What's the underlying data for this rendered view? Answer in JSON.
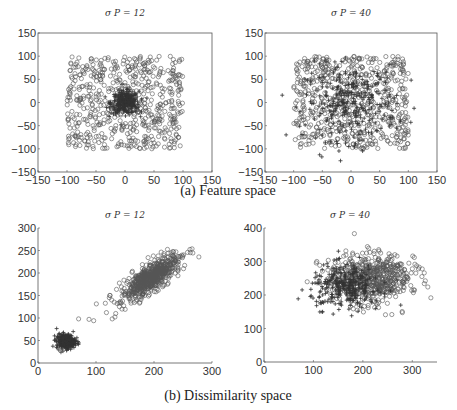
{
  "figure": {
    "caption_a": "(a) Feature space",
    "caption_b": "(b) Dissimilarity space"
  },
  "colors": {
    "axis": "#555555",
    "circle": "#555555",
    "plus": "#333333",
    "background": "#ffffff"
  },
  "chart_data": [
    {
      "id": "feature-sigma12",
      "type": "scatter",
      "title": "σ P = 12",
      "xlabel": "",
      "ylabel": "",
      "xlim": [
        -150,
        150
      ],
      "ylim": [
        -150,
        150
      ],
      "xticks": [
        -150,
        -100,
        -50,
        0,
        50,
        100,
        150
      ],
      "yticks": [
        -150,
        -100,
        -50,
        0,
        50,
        100,
        150
      ],
      "box": true,
      "grid": false,
      "pixel_box": {
        "x0": 38,
        "x1": 212,
        "y0": 172,
        "y1": 33
      },
      "series": [
        {
          "name": "class o",
          "marker": "circle",
          "distribution": "uniform",
          "x_range": [
            -100,
            100
          ],
          "y_range": [
            -100,
            100
          ],
          "count": 600
        },
        {
          "name": "class +",
          "marker": "plus",
          "distribution": "gaussian",
          "center": [
            0,
            0
          ],
          "sigma": 12,
          "count": 300
        }
      ]
    },
    {
      "id": "feature-sigma40",
      "type": "scatter",
      "title": "σ P = 40",
      "xlabel": "",
      "ylabel": "",
      "xlim": [
        -150,
        150
      ],
      "ylim": [
        -150,
        150
      ],
      "xticks": [
        -150,
        -100,
        -50,
        0,
        50,
        100,
        150
      ],
      "yticks": [
        -150,
        -100,
        -50,
        0,
        50,
        100,
        150
      ],
      "box": true,
      "grid": false,
      "pixel_box": {
        "x0": 265,
        "x1": 437,
        "y0": 172,
        "y1": 33
      },
      "series": [
        {
          "name": "class o",
          "marker": "circle",
          "distribution": "uniform",
          "x_range": [
            -100,
            100
          ],
          "y_range": [
            -100,
            100
          ],
          "count": 600
        },
        {
          "name": "class +",
          "marker": "plus",
          "distribution": "gaussian",
          "center": [
            0,
            0
          ],
          "sigma": 40,
          "count": 300
        }
      ]
    },
    {
      "id": "dissimilarity-sigma12",
      "type": "scatter",
      "title": "σ P = 12",
      "xlabel": "",
      "ylabel": "",
      "xlim": [
        0,
        300
      ],
      "ylim": [
        0,
        300
      ],
      "xticks": [
        0,
        100,
        200,
        300
      ],
      "yticks": [
        0,
        50,
        100,
        150,
        200,
        250,
        300
      ],
      "box": false,
      "grid": false,
      "pixel_box": {
        "x0": 38,
        "x1": 212,
        "y0": 363,
        "y1": 228
      },
      "series": [
        {
          "name": "class o",
          "marker": "circle",
          "distribution": "correlated",
          "center": [
            195,
            190
          ],
          "sigma_major": 32,
          "sigma_minor": 12,
          "angle_deg": 45,
          "count": 650
        },
        {
          "name": "class +",
          "marker": "plus",
          "distribution": "gaussian",
          "center": [
            48,
            48
          ],
          "sigma": 8,
          "count": 300
        },
        {
          "name": "class o (outliers)",
          "marker": "circle",
          "distribution": "points",
          "points": [
            [
              70,
              98
            ],
            [
              88,
              97
            ],
            [
              96,
              94
            ],
            [
              118,
              112
            ],
            [
              128,
              98
            ],
            [
              134,
              110
            ],
            [
              127,
              140
            ],
            [
              124,
              150
            ]
          ]
        }
      ]
    },
    {
      "id": "dissimilarity-sigma40",
      "type": "scatter",
      "title": "σ P = 40",
      "xlabel": "",
      "ylabel": "",
      "xlim": [
        0,
        350
      ],
      "ylim": [
        0,
        400
      ],
      "xticks": [
        0,
        100,
        200,
        300
      ],
      "yticks": [
        0,
        100,
        200,
        300,
        400
      ],
      "box": false,
      "grid": false,
      "pixel_box": {
        "x0": 264,
        "x1": 437,
        "y0": 362,
        "y1": 228
      },
      "series": [
        {
          "name": "class o",
          "marker": "circle",
          "distribution": "correlated",
          "center": [
            215,
            250
          ],
          "sigma_major": 42,
          "sigma_minor": 38,
          "angle_deg": 20,
          "count": 600
        },
        {
          "name": "class +",
          "marker": "plus",
          "distribution": "gaussian_xy",
          "center": [
            165,
            225
          ],
          "sigma_x": 35,
          "sigma_y": 32,
          "count": 300
        }
      ]
    }
  ]
}
